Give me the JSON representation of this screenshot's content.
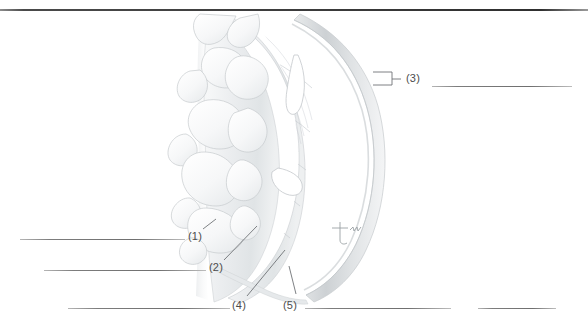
{
  "page": {
    "width": 588,
    "height": 330,
    "background": "#ffffff",
    "rule_color": "#3c3c3c"
  },
  "figure": {
    "name": "heart-wall-cross-section",
    "signature": "artist-signature-mark",
    "palette": {
      "outline": "#c9ccce",
      "muscle_light": "#f2f3f4",
      "muscle_mid": "#e3e6e8",
      "muscle_shadow": "#d2d6d9",
      "trabeculae": "#fafbfb",
      "epicardium": "#dcdfe1"
    }
  },
  "callouts": [
    {
      "id": "1",
      "label": "(1)",
      "x": 188,
      "y": 231
    },
    {
      "id": "2",
      "label": "(2)",
      "x": 209,
      "y": 262
    },
    {
      "id": "3",
      "label": "(3)",
      "x": 409,
      "y": 79
    },
    {
      "id": "4",
      "label": "(4)",
      "x": 232,
      "y": 300
    },
    {
      "id": "5",
      "label": "(5)",
      "x": 283,
      "y": 300
    }
  ],
  "answer_lines": [
    {
      "for": "1",
      "x": 20,
      "y": 239,
      "width": 165
    },
    {
      "for": "2",
      "x": 44,
      "y": 270,
      "width": 162
    },
    {
      "for": "3",
      "x": 432,
      "y": 86,
      "width": 140
    },
    {
      "for": "4",
      "x": 68,
      "y": 308,
      "width": 162
    },
    {
      "for": "5a",
      "x": 305,
      "y": 308,
      "width": 146
    },
    {
      "for": "5b",
      "x": 478,
      "y": 308,
      "width": 78
    }
  ],
  "leaders": [
    {
      "for": "1",
      "points": "203,230 215,221"
    },
    {
      "for": "2",
      "points": "224,261 256,227"
    },
    {
      "for": "3",
      "bracket": true,
      "points": "374,78 391,78"
    },
    {
      "for": "4",
      "points": "247,297 284,250"
    },
    {
      "for": "5",
      "points": "297,294 290,267"
    }
  ]
}
